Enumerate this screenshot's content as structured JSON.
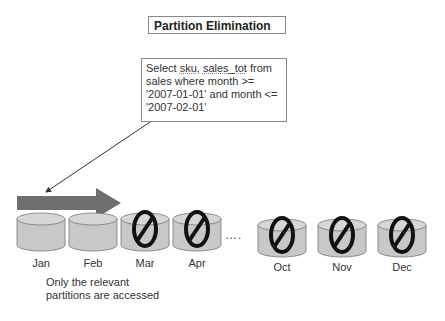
{
  "title": "Partition Elimination",
  "query": {
    "line1_pre": "Select ",
    "line1_sku": "sku",
    "line1_mid": ", ",
    "line1_sales": "sales_tot",
    "line1_post": " from",
    "line2": "sales where month >=",
    "line3": "'2007-01-01' and month <=",
    "line4": "'2007-02-01'"
  },
  "partitions": [
    {
      "label": "Jan",
      "eliminated": false
    },
    {
      "label": "Feb",
      "eliminated": false
    },
    {
      "label": "Mar",
      "eliminated": true
    },
    {
      "label": "Apr",
      "eliminated": true
    },
    {
      "label": "Oct",
      "eliminated": true
    },
    {
      "label": "Nov",
      "eliminated": true
    },
    {
      "label": "Dec",
      "eliminated": true
    }
  ],
  "ellipsis": "….",
  "note": {
    "line1": "Only the relevant",
    "line2": "partitions are accessed"
  },
  "colors": {
    "arrow": "#6e6e6e",
    "cylinder": "#c8c8c8",
    "prohibit": "#111111"
  }
}
